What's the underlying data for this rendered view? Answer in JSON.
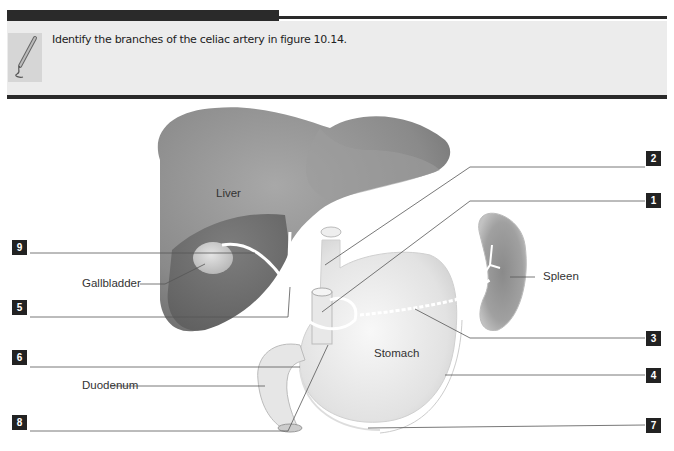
{
  "header": {
    "instruction": "Identify the branches of the celiac artery in figure 10.14."
  },
  "figure": {
    "organ_labels": {
      "liver": "Liver",
      "stomach": "Stomach",
      "spleen": "Spleen",
      "gallbladder": "Gallbladder",
      "duodenum": "Duodenum"
    },
    "callouts": [
      {
        "number": "1"
      },
      {
        "number": "2"
      },
      {
        "number": "3"
      },
      {
        "number": "4"
      },
      {
        "number": "5"
      },
      {
        "number": "6"
      },
      {
        "number": "7"
      },
      {
        "number": "8"
      },
      {
        "number": "9"
      }
    ]
  }
}
